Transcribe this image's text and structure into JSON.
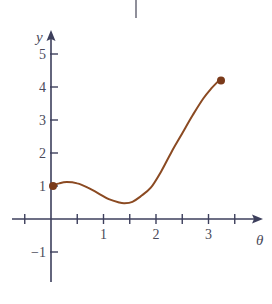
{
  "chart_data": {
    "type": "line",
    "title": "",
    "xlabel": "θ",
    "ylabel": "y",
    "xlim": [
      -0.75,
      4.0
    ],
    "ylim": [
      -1.7,
      5.7
    ],
    "grid": false,
    "legend": null,
    "x_ticks": [
      -0.5,
      0.5,
      1,
      1.5,
      2,
      2.5,
      3,
      3.5
    ],
    "x_tick_labels": [
      {
        "value": 1,
        "label": "1"
      },
      {
        "value": 2,
        "label": "2"
      },
      {
        "value": 3,
        "label": "3"
      }
    ],
    "y_ticks": [
      -1,
      1,
      2,
      3,
      4,
      5
    ],
    "y_tick_labels": [
      {
        "value": -1,
        "label": "−1"
      },
      {
        "value": 1,
        "label": "1"
      },
      {
        "value": 2,
        "label": "2"
      },
      {
        "value": 3,
        "label": "3"
      },
      {
        "value": 4,
        "label": "4"
      },
      {
        "value": 5,
        "label": "5"
      }
    ],
    "series": [
      {
        "name": "curve",
        "color": "#8b4a22",
        "x": [
          0.0,
          0.15,
          0.3,
          0.5,
          0.7,
          0.9,
          1.1,
          1.3,
          1.4,
          1.55,
          1.7,
          1.9,
          2.1,
          2.3,
          2.5,
          2.7,
          2.9,
          3.05,
          3.2
        ],
        "values": [
          1.0,
          1.08,
          1.12,
          1.08,
          0.95,
          0.78,
          0.6,
          0.5,
          0.48,
          0.52,
          0.68,
          0.95,
          1.45,
          2.05,
          2.6,
          3.15,
          3.65,
          3.95,
          4.2
        ]
      }
    ],
    "endpoints": [
      {
        "x": 0.0,
        "y": 1.0,
        "marker": "filled-circle"
      },
      {
        "x": 3.2,
        "y": 4.2,
        "marker": "filled-circle"
      }
    ],
    "colors": {
      "axis": "#3d3f5c",
      "curve": "#8b4a22",
      "dot": "#7a3a1a"
    }
  }
}
